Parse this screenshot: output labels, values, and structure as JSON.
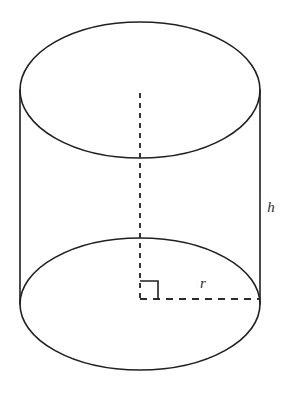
{
  "figure": {
    "name": "right-circular-cylinder-diagram",
    "background_color": "#ffffff",
    "stroke_color": "#231f20",
    "dashed_color": "#2b2b2b",
    "label_color": "#2b2b2b",
    "canvas": {
      "width": 289,
      "height": 396
    }
  },
  "geometry": {
    "top_ellipse": {
      "cx": 140,
      "cy": 90,
      "rx": 120,
      "ry": 68,
      "style": "solid"
    },
    "bottom_ellipse": {
      "cx": 140,
      "cy": 304,
      "rx": 120,
      "ry": 66,
      "style": "solid"
    },
    "left_edge": {
      "x": 20,
      "y1": 90,
      "y2": 304,
      "style": "solid"
    },
    "right_edge": {
      "x": 260,
      "y1": 90,
      "y2": 304,
      "style": "solid"
    },
    "axis_dashed": {
      "x": 140,
      "y1": 93,
      "y2": 299,
      "style": "dashed"
    },
    "radius_dashed": {
      "y": 299,
      "x1": 140,
      "x2": 260,
      "style": "dashed"
    },
    "right_angle_marker": {
      "x": 140,
      "y": 281,
      "size": 18,
      "style": "solid"
    }
  },
  "labels": {
    "height": {
      "text": "h",
      "x": 271,
      "y": 212
    },
    "radius": {
      "text": "r",
      "x": 203,
      "y": 288
    }
  }
}
